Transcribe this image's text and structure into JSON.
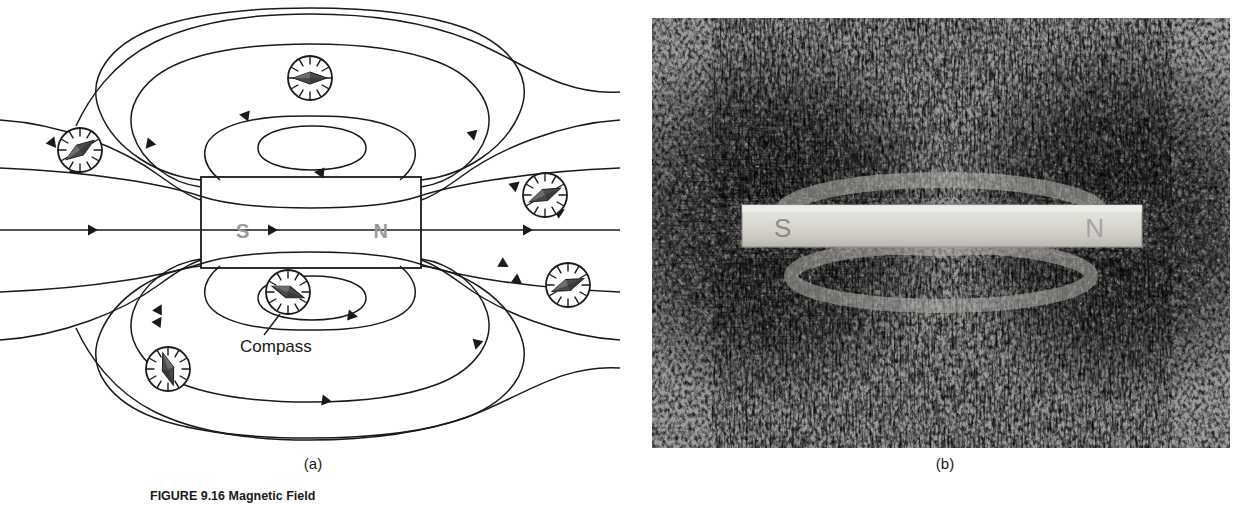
{
  "figure": {
    "caption_number": "FIGURE 9.16",
    "caption_title": "Magnetic Field",
    "panels": [
      {
        "id": "a",
        "label": "(a)",
        "type": "line-diagram"
      },
      {
        "id": "b",
        "label": "(b)",
        "type": "photograph"
      }
    ]
  },
  "diagram": {
    "magnet": {
      "south_label": "S",
      "north_label": "N",
      "pole_label_color": "#9a9a9a",
      "outline_color": "#1a1a1a"
    },
    "annotation": {
      "compass_label": "Compass"
    },
    "compasses": [
      {
        "name": "compass-top",
        "x": 310,
        "y": 78,
        "r": 22,
        "angle": 0
      },
      {
        "name": "compass-upper-left",
        "x": 80,
        "y": 150,
        "r": 22,
        "angle": -35
      },
      {
        "name": "compass-upper-right",
        "x": 545,
        "y": 195,
        "r": 22,
        "angle": -24
      },
      {
        "name": "compass-lower-right",
        "x": 568,
        "y": 285,
        "r": 22,
        "angle": -22
      },
      {
        "name": "compass-bottom",
        "x": 288,
        "y": 292,
        "r": 22,
        "angle": 20
      },
      {
        "name": "compass-lower-left",
        "x": 168,
        "y": 369,
        "r": 22,
        "angle": 72
      }
    ],
    "field_line_color": "#1a1a1a",
    "field_line_count": 9,
    "arrow_direction_note": "field lines run from N pole outward, around, and back into the S pole"
  },
  "photo": {
    "magnet_fill": "#d8d6d0",
    "south_label": "S",
    "north_label": "N",
    "background": "#9d9d9d",
    "filings_color": "#121212",
    "description": "iron filings arranged along magnetic field lines around a bar magnet"
  },
  "colors": {
    "page_background": "#ffffff",
    "ink": "#1a1a1a",
    "pole_gray": "#9a9a9a"
  }
}
